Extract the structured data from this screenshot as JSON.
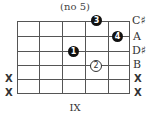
{
  "title": "(no 5)",
  "fret_position": "IX",
  "string_labels": [
    "C♯",
    "A",
    "D♯",
    "B",
    "X",
    "X"
  ],
  "left_marks": [
    "",
    "",
    "",
    "",
    "X",
    "X"
  ],
  "fingers": [
    {
      "finger": "3",
      "string": 1,
      "fret": 4,
      "style": "filled"
    },
    {
      "finger": "4",
      "string": 2,
      "fret": 5,
      "style": "filled"
    },
    {
      "finger": "1",
      "string": 3,
      "fret": 3,
      "style": "filled"
    },
    {
      "finger": "2",
      "string": 4,
      "fret": 4,
      "style": "open"
    }
  ]
}
